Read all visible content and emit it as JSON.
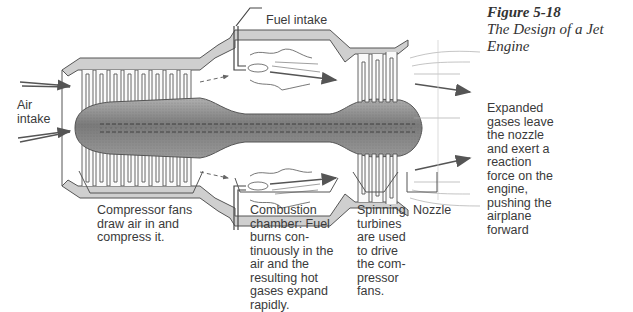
{
  "figure": {
    "number": "Figure 5-18",
    "caption": "The Design of a Jet Engine"
  },
  "labels": {
    "air_intake": "Air\nintake",
    "fuel_intake": "Fuel intake",
    "compressor": "Compressor fans\ndraw air in and\ncompress it.",
    "combustion": "Combustion\nchamber: Fuel\nburns con-\ntinuously in the\nair and the\nresulting hot\ngases expand\nrapidly.",
    "turbines": "Spinning\nturbines\nare used\nto drive\nthe com-\npressor\nfans.",
    "nozzle": "Nozzle",
    "exhaust": "Expanded\ngases leave\nthe nozzle\nand exert a\nreaction\nforce on the\nengine,\npushing the\nairplane\nforward"
  },
  "colors": {
    "casing_fill": "#c8c8c8",
    "casing_stroke": "#555555",
    "spindle_fill": "#8a8a8a",
    "arrow": "#555555",
    "text": "#3a3a3a"
  }
}
